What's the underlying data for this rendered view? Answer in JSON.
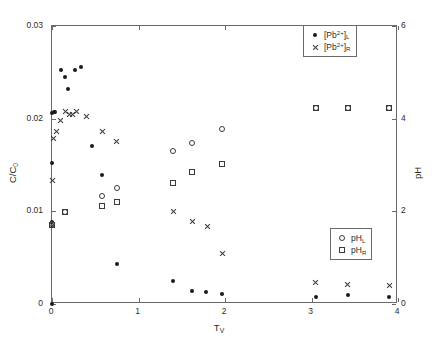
{
  "chart_data": {
    "type": "scatter",
    "title": "",
    "xlabel": "T_V",
    "ylabel": "C/C0",
    "ylabel_right": "pH",
    "xlim": [
      0,
      4
    ],
    "ylim": [
      0,
      0.03
    ],
    "ylim_right": [
      0,
      6
    ],
    "grid": false,
    "xticks": [
      "0",
      "1",
      "2",
      "3",
      "4"
    ],
    "xtick_values": [
      0,
      1,
      2,
      3,
      4
    ],
    "yticks": [
      "0",
      "0.01",
      "0.02",
      "0.03"
    ],
    "ytick_values": [
      0,
      0.01,
      0.02,
      0.03
    ],
    "yticks_right": [
      "0",
      "2",
      "4",
      "6"
    ],
    "ytick_values_right": [
      0,
      2,
      4,
      6
    ],
    "legend_position": [
      "top-right",
      "bottom-right"
    ],
    "series": [
      {
        "name": "[Pb2+]L",
        "label_html": "[Pb<sup>2+</sup>]<sub>L</sub>",
        "marker": "dot",
        "axis": "left",
        "points": [
          [
            0.0,
            0.0
          ],
          [
            0.0,
            0.0088
          ],
          [
            0.0,
            0.0152
          ],
          [
            0.0,
            0.0206
          ],
          [
            0.02,
            0.0207
          ],
          [
            0.04,
            0.0207
          ],
          [
            0.1,
            0.0253
          ],
          [
            0.15,
            0.0245
          ],
          [
            0.18,
            0.0232
          ],
          [
            0.27,
            0.0252
          ],
          [
            0.33,
            0.0256
          ],
          [
            0.46,
            0.0171
          ],
          [
            0.58,
            0.0139
          ],
          [
            0.75,
            0.0043
          ],
          [
            1.4,
            0.0025
          ],
          [
            1.62,
            0.0014
          ],
          [
            1.78,
            0.0013
          ],
          [
            1.97,
            0.0011
          ],
          [
            3.05,
            0.0008
          ],
          [
            3.42,
            0.001
          ],
          [
            3.9,
            0.0008
          ]
        ]
      },
      {
        "name": "[Pb2+]R",
        "label_html": "[Pb<sup>2+</sup>]<sub>R</sub>",
        "marker": "cross",
        "axis": "left",
        "points": [
          [
            0.0,
            0.0085
          ],
          [
            0.0,
            0.0133
          ],
          [
            0.02,
            0.0179
          ],
          [
            0.05,
            0.0186
          ],
          [
            0.1,
            0.0198
          ],
          [
            0.16,
            0.0208
          ],
          [
            0.2,
            0.0205
          ],
          [
            0.24,
            0.0205
          ],
          [
            0.28,
            0.0208
          ],
          [
            0.4,
            0.0202
          ],
          [
            0.58,
            0.0186
          ],
          [
            0.75,
            0.0175
          ],
          [
            1.4,
            0.01
          ],
          [
            1.62,
            0.0089
          ],
          [
            1.8,
            0.0084
          ],
          [
            1.97,
            0.0055
          ],
          [
            3.05,
            0.0023
          ],
          [
            3.42,
            0.0021
          ],
          [
            3.9,
            0.002
          ]
        ]
      },
      {
        "name": "pHL",
        "label_html": "pH<sub>L</sub>",
        "marker": "circle",
        "axis": "right",
        "points": [
          [
            0.0,
            1.72
          ],
          [
            0.15,
            1.98
          ],
          [
            0.58,
            2.34
          ],
          [
            0.75,
            2.5
          ],
          [
            1.4,
            3.3
          ],
          [
            1.62,
            3.47
          ],
          [
            1.97,
            3.78
          ],
          [
            3.05,
            4.22
          ],
          [
            3.42,
            4.22
          ],
          [
            3.9,
            4.22
          ]
        ]
      },
      {
        "name": "pHR",
        "label_html": "pH<sub>R</sub>",
        "marker": "square",
        "axis": "right",
        "points": [
          [
            0.0,
            1.7
          ],
          [
            0.15,
            1.98
          ],
          [
            0.58,
            2.12
          ],
          [
            0.75,
            2.2
          ],
          [
            1.4,
            2.62
          ],
          [
            1.62,
            2.84
          ],
          [
            1.97,
            3.02
          ],
          [
            3.05,
            4.22
          ],
          [
            3.42,
            4.22
          ],
          [
            3.9,
            4.22
          ]
        ]
      }
    ]
  },
  "axes": {
    "x_title": "T",
    "x_title_sub": "V",
    "y_title": "C/C",
    "y_title_sub": "0",
    "y_right_title": "pH"
  },
  "legend_pb": {
    "items": [
      {
        "marker": "dot",
        "text": "[Pb",
        "sup": "2+",
        "close": "]",
        "sub": "L"
      },
      {
        "marker": "cross",
        "text": "[Pb",
        "sup": "2+",
        "close": "]",
        "sub": "R"
      }
    ]
  },
  "legend_ph": {
    "items": [
      {
        "marker": "circle",
        "text": "pH",
        "sub": "L"
      },
      {
        "marker": "square",
        "text": "pH",
        "sub": "R"
      }
    ]
  }
}
